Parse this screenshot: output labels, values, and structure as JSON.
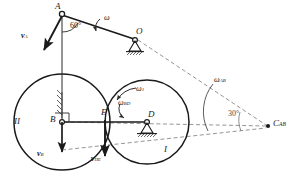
{
  "figure": {
    "type": "kinematics-mechanism-diagram",
    "background_color": "#ffffff",
    "stroke_color": "#1a1a1a",
    "dash_color": "#6e6e6e"
  },
  "points": {
    "a": {
      "label": "A",
      "x": 62,
      "y": 14
    },
    "o": {
      "label": "O",
      "x": 134,
      "y": 37
    },
    "b": {
      "label": "B",
      "x": 62,
      "y": 122
    },
    "e": {
      "label": "E",
      "x": 106,
      "y": 120
    },
    "d": {
      "label": "D",
      "x": 147,
      "y": 120
    },
    "c_ab": {
      "label": "C",
      "sub": "AB",
      "x": 268,
      "y": 126
    }
  },
  "bodies": {
    "disk_two": {
      "label": "II",
      "x": 18,
      "y": 124
    },
    "disk_one": {
      "label": "I",
      "x": 166,
      "y": 152
    }
  },
  "angles": {
    "at_a": {
      "label": "60",
      "unit": "°",
      "x": 74,
      "y": 26
    },
    "at_c": {
      "label": "30",
      "unit": "°",
      "x": 231,
      "y": 115
    }
  },
  "velocities": [
    {
      "symbol": "v",
      "sub": "A",
      "x": 22,
      "y": 33
    },
    {
      "symbol": "v",
      "sub": "B",
      "x": 38,
      "y": 155
    },
    {
      "symbol": "v",
      "sub": "IIE",
      "x": 93,
      "y": 160
    }
  ],
  "angular_velocities": [
    {
      "symbol": "ω",
      "sub": "",
      "x": 106,
      "y": 18
    },
    {
      "symbol": "ω",
      "sub": "1",
      "x": 137,
      "y": 90
    },
    {
      "symbol": "ω",
      "sub": "BD",
      "x": 122,
      "y": 108
    },
    {
      "symbol": "ω",
      "sub": "AB",
      "x": 219,
      "y": 80
    }
  ]
}
